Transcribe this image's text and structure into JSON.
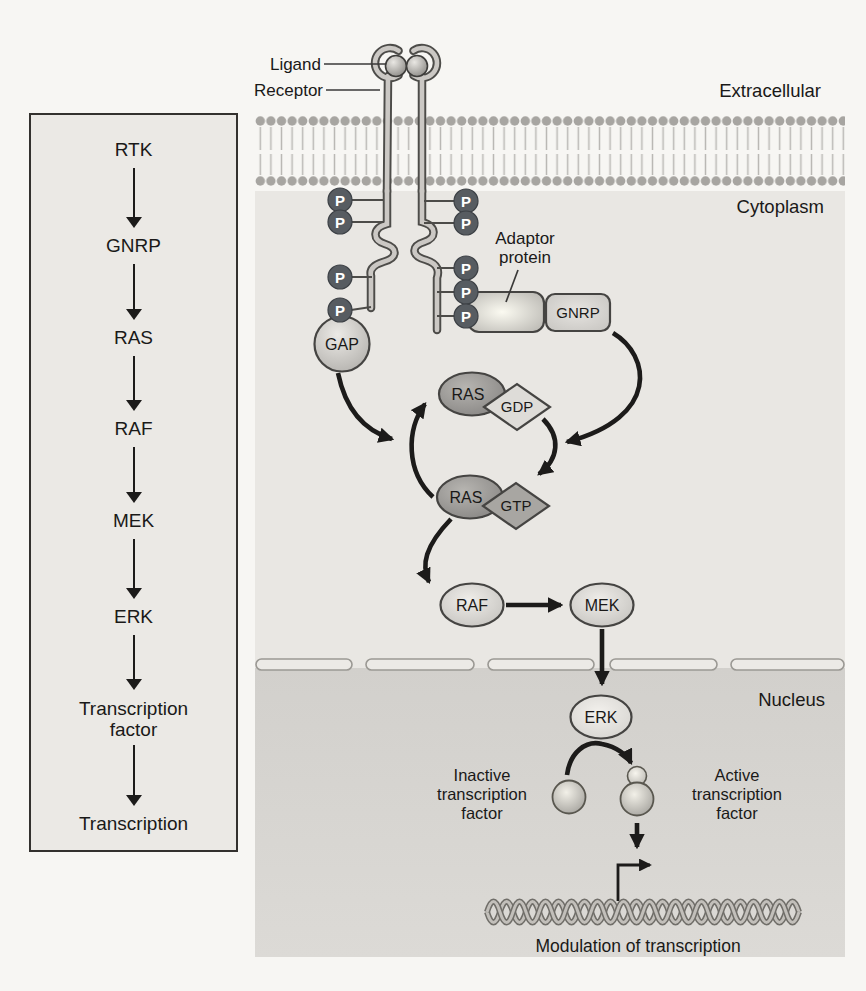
{
  "colors": {
    "page_bg": "#f7f6f3",
    "sidebar_bg": "#ebe9e5",
    "sidebar_border": "#33312e",
    "cytoplasm_bg": "#e9e7e3",
    "nucleus_top": "#d2d0cc",
    "nucleus_bottom": "#dcdad6",
    "membrane_head": "#a7a5a1",
    "membrane_tail": "#bab8b4",
    "outline_dark": "#4d4c49",
    "tube_light": "#cbc8c4",
    "arrow": "#1c1b1a",
    "phosphate_fill": "#575c61",
    "phosphate_text": "#ffffff",
    "gdp_fill": "#dedcd8",
    "gtp_fill": "#a8a6a2",
    "text": "#1a1918"
  },
  "sidebar": {
    "steps": [
      "RTK",
      "GNRP",
      "RAS",
      "RAF",
      "MEK",
      "ERK",
      "Transcription factor",
      "Transcription"
    ]
  },
  "main": {
    "regions": {
      "extracellular": "Extracellular",
      "cytoplasm": "Cytoplasm",
      "nucleus": "Nucleus"
    },
    "receptor": {
      "ligand_label": "Ligand",
      "receptor_label": "Receptor"
    },
    "phosphate_label": "P",
    "adaptor_label_line1": "Adaptor",
    "adaptor_label_line2": "protein",
    "nodes": {
      "gap": "GAP",
      "gnrp": "GNRP",
      "ras": "RAS",
      "gdp": "GDP",
      "gtp": "GTP",
      "raf": "RAF",
      "mek": "MEK",
      "erk": "ERK"
    },
    "tf": {
      "inactive_lines": [
        "Inactive",
        "transcription",
        "factor"
      ],
      "active_lines": [
        "Active",
        "transcription",
        "factor"
      ]
    },
    "dna_caption": "Modulation of transcription"
  }
}
